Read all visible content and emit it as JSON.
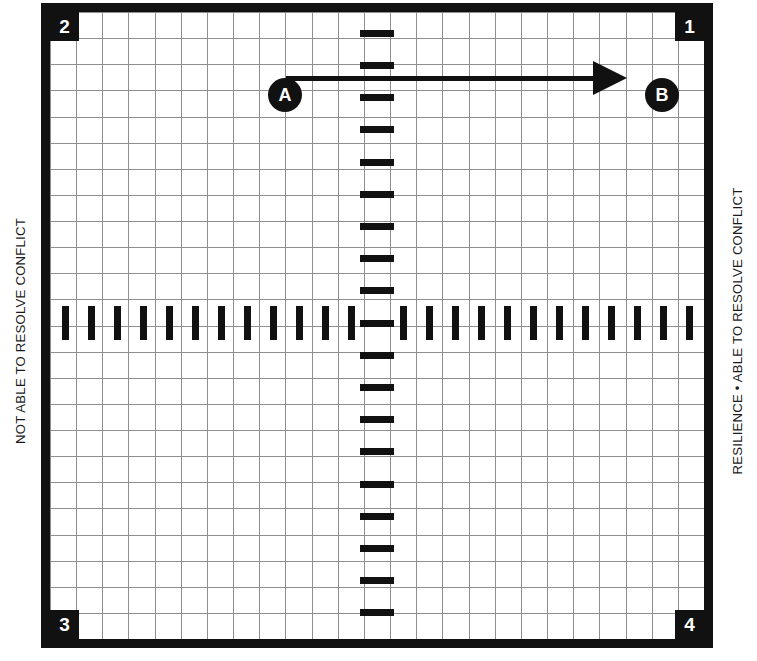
{
  "diagram": {
    "type": "conflict-resilience-quadrant-grid",
    "axis_labels": {
      "left": "NOT ABLE TO RESOLVE CONFLICT",
      "right": "RESILIENCE • ABLE TO RESOLVE CONFLICT"
    },
    "quadrant_badges": [
      {
        "id": "q2",
        "label": "2",
        "position": "top-left"
      },
      {
        "id": "q1",
        "label": "1",
        "position": "top-right"
      },
      {
        "id": "q3",
        "label": "3",
        "position": "bottom-left"
      },
      {
        "id": "q4",
        "label": "4",
        "position": "bottom-right"
      }
    ],
    "markers": [
      {
        "id": "a",
        "label": "A",
        "x": 218,
        "y": 66
      },
      {
        "id": "b",
        "label": "B",
        "x": 595,
        "y": 66
      }
    ],
    "arrow": {
      "from": "A",
      "to": "B",
      "direction": "left-to-right",
      "shaft_x": 236,
      "shaft_y": 64,
      "shaft_width": 307,
      "head_x": 543,
      "head_y": 49
    },
    "grid": {
      "cell_size_px": 26,
      "columns": 25,
      "rows": 24,
      "line_color": "#8f8f8f",
      "visible": true
    },
    "axes": {
      "horizontal_axis_y": 311,
      "vertical_axis_x": 327,
      "horizontal_tick_count": 18,
      "vertical_tick_count": 18,
      "tick_color": "#111111"
    },
    "colors": {
      "frame": "#111111",
      "grid": "#8f8f8f",
      "background": "#ffffff",
      "marker": "#111111",
      "marker_text": "#ffffff"
    }
  }
}
